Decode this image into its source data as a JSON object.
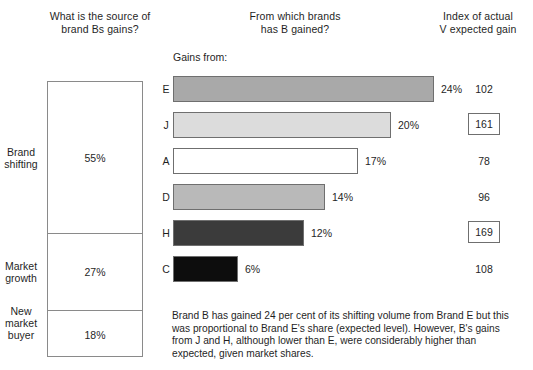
{
  "headers": {
    "left": "What is the source of\nbrand Bs gains?",
    "left_line1": "What is the source of",
    "left_line2": "brand Bs gains?",
    "middle_line1": "From which brands",
    "middle_line2": "has B gained?",
    "right_line1": "Index of actual",
    "right_line2": "V expected gain"
  },
  "gains_from_label": "Gains from:",
  "source_box": {
    "segments": [
      {
        "label_line1": "Brand",
        "label_line2": "shifting",
        "label_line3": "",
        "value": "55%"
      },
      {
        "label_line1": "Market",
        "label_line2": "growth",
        "label_line3": "",
        "value": "27%"
      },
      {
        "label_line1": "New",
        "label_line2": "market",
        "label_line3": "buyer",
        "value": "18%"
      }
    ]
  },
  "chart_data": {
    "type": "bar",
    "title": "From which brands has B gained?",
    "xlabel": "",
    "ylabel": "",
    "orientation": "horizontal",
    "grid": false,
    "legend": false,
    "categories": [
      "E",
      "J",
      "A",
      "D",
      "H",
      "C"
    ],
    "values": [
      24,
      20,
      17,
      14,
      12,
      6
    ],
    "value_labels": [
      "24%",
      "20%",
      "17%",
      "14%",
      "12%",
      "6%"
    ],
    "index_values": [
      102,
      161,
      78,
      96,
      169,
      108
    ],
    "index_labels": [
      "102",
      "161",
      "78",
      "96",
      "169",
      "108"
    ],
    "index_highlighted": [
      false,
      true,
      false,
      false,
      true,
      false
    ],
    "bar_colors": [
      "#a9a9a9",
      "#dcdcdc",
      "#ffffff",
      "#b9b9b9",
      "#3b3b3b",
      "#0d0d0d"
    ],
    "xlim": [
      0,
      26
    ],
    "source_categories": [
      "Brand shifting",
      "Market growth",
      "New market buyer"
    ],
    "source_values": [
      55,
      27,
      18
    ]
  },
  "caption": "Brand B has gained 24 per cent of its shifting volume from Brand E but this was proportional to Brand E's share (expected level). However, B's gains from J and H, although lower than E, were considerably higher than expected, given market shares."
}
